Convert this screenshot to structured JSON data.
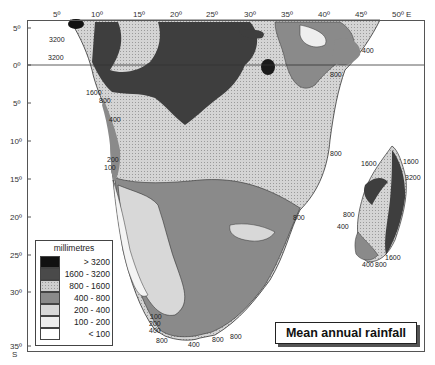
{
  "map": {
    "title": "Mean annual rainfall",
    "region": "Southern and central Africa with Madagascar",
    "axes": {
      "longitude_ticks": [
        "5º",
        "10º",
        "15º",
        "20º",
        "25º",
        "30º",
        "35º",
        "40º",
        "45º",
        "50º E"
      ],
      "latitude_ticks": [
        "5º",
        "0º",
        "5º",
        "10º",
        "15º",
        "20º",
        "25º",
        "30º",
        "35º"
      ],
      "latitude_suffix": "S"
    },
    "legend": {
      "title": "millimetres",
      "items": [
        {
          "label": "> 3200",
          "color": "#111111"
        },
        {
          "label": "1600 - 3200",
          "color": "#4a4a4a"
        },
        {
          "label": "800 - 1600",
          "color": "#cfcfcf"
        },
        {
          "label": "400 - 800",
          "color": "#8a8a8a"
        },
        {
          "label": "200 - 400",
          "color": "#d8d8d8"
        },
        {
          "label": "100 - 200",
          "color": "#eeeeee"
        },
        {
          "label": "< 100",
          "color": "#ffffff"
        }
      ]
    },
    "contour_labels": [
      {
        "text": "3200",
        "x": 49,
        "y": 40
      },
      {
        "text": "3200",
        "x": 48,
        "y": 58
      },
      {
        "text": "1600",
        "x": 86,
        "y": 93
      },
      {
        "text": "800",
        "x": 99,
        "y": 101
      },
      {
        "text": "400",
        "x": 109,
        "y": 120
      },
      {
        "text": "200",
        "x": 107,
        "y": 160
      },
      {
        "text": "100",
        "x": 104,
        "y": 167
      },
      {
        "text": "400",
        "x": 362,
        "y": 50
      },
      {
        "text": "800",
        "x": 330,
        "y": 73
      },
      {
        "text": "800",
        "x": 330,
        "y": 152
      },
      {
        "text": "800",
        "x": 293,
        "y": 216
      },
      {
        "text": "1600",
        "x": 361,
        "y": 162
      },
      {
        "text": "1600",
        "x": 403,
        "y": 160
      },
      {
        "text": "3200",
        "x": 405,
        "y": 176
      },
      {
        "text": "800",
        "x": 343,
        "y": 213
      },
      {
        "text": "400",
        "x": 337,
        "y": 225
      },
      {
        "text": "1600",
        "x": 385,
        "y": 253
      },
      {
        "text": "400",
        "x": 362,
        "y": 260
      },
      {
        "text": "800",
        "x": 375,
        "y": 260
      },
      {
        "text": "100",
        "x": 153,
        "y": 314
      },
      {
        "text": "200",
        "x": 152,
        "y": 321
      },
      {
        "text": "400",
        "x": 152,
        "y": 328
      },
      {
        "text": "800",
        "x": 157,
        "y": 338
      },
      {
        "text": "400",
        "x": 189,
        "y": 341
      },
      {
        "text": "800",
        "x": 212,
        "y": 337
      },
      {
        "text": "800",
        "x": 230,
        "y": 333
      }
    ]
  }
}
